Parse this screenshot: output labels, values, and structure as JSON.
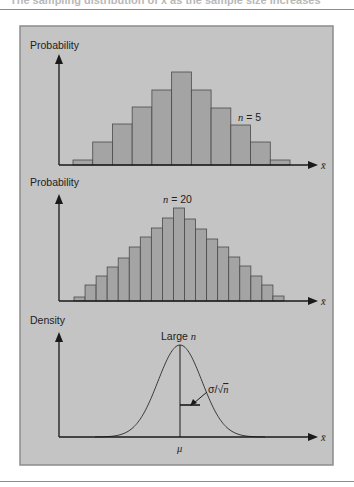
{
  "page": {
    "caption": "The sampling distribution of x̄ as the sample size increases"
  },
  "colors": {
    "panel_bg": "#c4c4c4",
    "panel_border": "#8c8c8c",
    "bar_fill": "#a4a4a4",
    "bar_stroke": "#4a4a4a",
    "axis": "#1a1a1a",
    "curve": "#3a3a3a"
  },
  "chart_data": [
    {
      "type": "bar",
      "title": "",
      "ylabel": "Probability",
      "xlabel": "x̄",
      "annotation": "n = 5",
      "annotation_n": "n",
      "annotation_rest": " = 5",
      "categories": [
        "1",
        "2",
        "3",
        "4",
        "5",
        "6",
        "7",
        "8",
        "9",
        "10",
        "11"
      ],
      "values": [
        5,
        23,
        41,
        58,
        75,
        93,
        75,
        57,
        40,
        23,
        5
      ],
      "ylim": [
        0,
        100
      ],
      "grid": false,
      "legend": "none"
    },
    {
      "type": "bar",
      "title": "",
      "ylabel": "Probability",
      "xlabel": "x̄",
      "annotation": "n = 20",
      "annotation_n": "n",
      "annotation_rest": " = 20",
      "categories": [
        "1",
        "2",
        "3",
        "4",
        "5",
        "6",
        "7",
        "8",
        "9",
        "10",
        "11",
        "12",
        "13",
        "14",
        "15",
        "16",
        "17",
        "18",
        "19"
      ],
      "values": [
        4,
        16,
        25,
        34,
        43,
        54,
        64,
        73,
        83,
        93,
        82,
        72,
        62,
        54,
        44,
        35,
        25,
        16,
        5
      ],
      "ylim": [
        0,
        100
      ],
      "grid": false,
      "legend": "none"
    },
    {
      "type": "line",
      "title": "",
      "ylabel": "Density",
      "xlabel": "x̄",
      "annotation": "Large n",
      "annotation_text": "Large ",
      "annotation_n": "n",
      "center_label": "μ",
      "spread_label": "σ/√n",
      "spread_sigma": "σ/",
      "spread_root": "√",
      "spread_n": "n",
      "curve": "normal density centered at μ",
      "grid": false,
      "legend": "none"
    }
  ]
}
